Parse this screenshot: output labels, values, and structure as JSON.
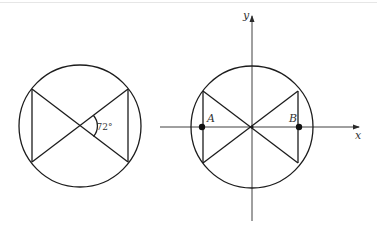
{
  "diagram": {
    "left_figure": {
      "angle_label": "72°",
      "circle": {
        "cx": 80,
        "cy": 126,
        "r": 61
      },
      "vertices": {
        "top_left": [
          32,
          89
        ],
        "bottom_left": [
          32,
          162
        ],
        "top_right": [
          128,
          89
        ],
        "bottom_right": [
          128,
          162
        ]
      },
      "angle_value_degrees": 72
    },
    "right_figure": {
      "circle": {
        "cx": 252,
        "cy": 127,
        "r": 61
      },
      "vertices": {
        "top_left": [
          203,
          91
        ],
        "bottom_left": [
          203,
          163
        ],
        "top_right": [
          298,
          91
        ],
        "bottom_right": [
          298,
          163
        ]
      },
      "axes": {
        "x_label": "x",
        "y_label": "y",
        "x_range_px": [
          160,
          360
        ],
        "y_range_px": [
          15,
          221
        ]
      },
      "points": [
        {
          "name": "A",
          "label": "A",
          "x": 202,
          "y": 127
        },
        {
          "name": "B",
          "label": "B",
          "x": 299,
          "y": 127
        }
      ]
    },
    "colors": {
      "line": "#1c1c1c",
      "text": "#333333",
      "background": "#ffffff"
    }
  }
}
